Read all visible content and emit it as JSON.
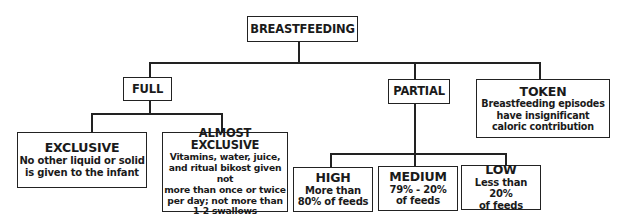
{
  "diagram": {
    "root": {
      "title": "BREASTFEEDING"
    },
    "full": {
      "title": "FULL",
      "children": [
        {
          "title": "EXCLUSIVE",
          "lines": [
            "No other liquid or solid",
            "is given to the infant"
          ]
        },
        {
          "title": "ALMOST EXCLUSIVE",
          "lines": [
            "Vitamins, water, juice,",
            "and ritual bikost given not",
            "more than once or twice",
            "per day; not more than",
            "1-2 swallows"
          ]
        }
      ]
    },
    "partial": {
      "title": "PARTIAL",
      "children": [
        {
          "title": "HIGH",
          "lines": [
            "More than",
            "80% of feeds"
          ]
        },
        {
          "title": "MEDIUM",
          "lines": [
            "79% - 20%",
            "of feeds"
          ]
        },
        {
          "title": "LOW",
          "lines": [
            "Less than 20%",
            "of feeds"
          ]
        }
      ]
    },
    "token": {
      "title": "TOKEN",
      "lines": [
        "Breastfeeding episodes",
        "have insignificant",
        "caloric contribution"
      ]
    }
  }
}
